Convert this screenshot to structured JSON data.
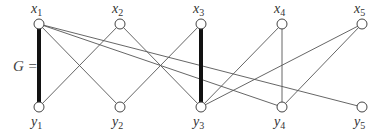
{
  "diagram": {
    "graph_label": "G =",
    "colors": {
      "edge": "#555555",
      "matching_edge": "#111111",
      "node_fill": "#ffffff",
      "node_stroke": "#444444"
    },
    "top_nodes": [
      {
        "id": "x1",
        "base": "x",
        "sub": "1",
        "x": 39,
        "y": 24
      },
      {
        "id": "x2",
        "base": "x",
        "sub": "2",
        "x": 120,
        "y": 24
      },
      {
        "id": "x3",
        "base": "x",
        "sub": "3",
        "x": 201,
        "y": 24
      },
      {
        "id": "x4",
        "base": "x",
        "sub": "4",
        "x": 282,
        "y": 24
      },
      {
        "id": "x5",
        "base": "x",
        "sub": "5",
        "x": 362,
        "y": 24
      }
    ],
    "bottom_nodes": [
      {
        "id": "y1",
        "base": "y",
        "sub": "1",
        "x": 39,
        "y": 107
      },
      {
        "id": "y2",
        "base": "y",
        "sub": "2",
        "x": 120,
        "y": 107
      },
      {
        "id": "y3",
        "base": "y",
        "sub": "3",
        "x": 201,
        "y": 107
      },
      {
        "id": "y4",
        "base": "y",
        "sub": "4",
        "x": 282,
        "y": 107
      },
      {
        "id": "y5",
        "base": "y",
        "sub": "5",
        "x": 362,
        "y": 107
      }
    ],
    "edges": [
      {
        "from": "x1",
        "to": "y1",
        "thick": true
      },
      {
        "from": "x1",
        "to": "y2",
        "thick": false
      },
      {
        "from": "x1",
        "to": "y4",
        "thick": false
      },
      {
        "from": "x1",
        "to": "y5",
        "thick": false
      },
      {
        "from": "x2",
        "to": "y1",
        "thick": false
      },
      {
        "from": "x2",
        "to": "y3",
        "thick": false
      },
      {
        "from": "x3",
        "to": "y2",
        "thick": false
      },
      {
        "from": "x3",
        "to": "y3",
        "thick": true
      },
      {
        "from": "x4",
        "to": "y3",
        "thick": false
      },
      {
        "from": "x4",
        "to": "y4",
        "thick": false
      },
      {
        "from": "x5",
        "to": "y3",
        "thick": false
      },
      {
        "from": "x5",
        "to": "y4",
        "thick": false
      }
    ]
  }
}
